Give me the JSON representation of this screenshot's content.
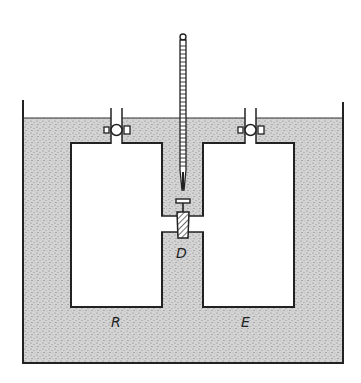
{
  "diagram": {
    "labels": {
      "vessel_left": "R",
      "vessel_right": "E",
      "connecting_valve": "D"
    },
    "colors": {
      "water": "#cfcfcf",
      "stroke": "#222222",
      "background": "#ffffff"
    }
  }
}
